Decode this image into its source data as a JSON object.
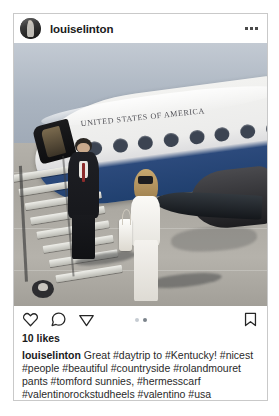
{
  "post": {
    "header": {
      "username": "louiselinton",
      "avatar_icon": "user-avatar",
      "more_icon": "more-options-icon"
    },
    "photo": {
      "alt_description": "Woman in white pantsuit and man in dark suit descending airstairs of a United States of America government jet on tarmac",
      "aircraft_livery_text": "UNITED STATES OF AMERICA"
    },
    "actions": {
      "like_icon": "heart-icon",
      "comment_icon": "comment-bubble-icon",
      "share_icon": "share-paper-plane-icon",
      "save_icon": "bookmark-icon",
      "carousel": {
        "total": 2,
        "active_index": 1
      }
    },
    "likes_text": "10 likes",
    "caption": {
      "username": "louiselinton",
      "text": "Great #daytrip to #Kentucky! #nicest #people #beautiful #countryside #rolandmouret pants #tomford sunnies, #hermesscarf #valentinorockstudheels #valentino #usa"
    }
  },
  "colors": {
    "card_border": "#c9c9c9",
    "text_primary": "#1a1a1a",
    "text_body": "#2a2a2a",
    "icon_stroke": "#262626",
    "dot_active": "#7b838b",
    "dot_inactive": "#c6ccd2",
    "page_background": "#ffffff"
  }
}
